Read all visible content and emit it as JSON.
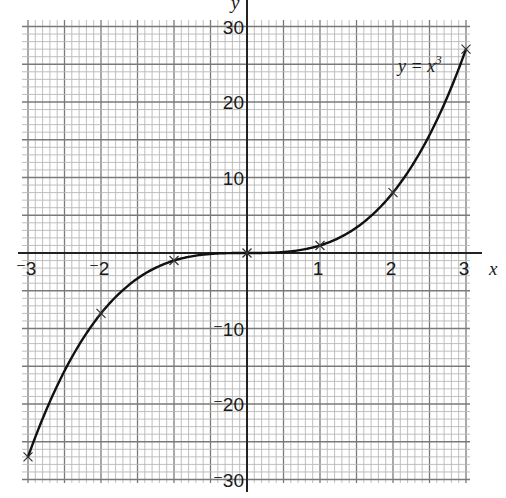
{
  "chart_data": {
    "type": "line",
    "title": "",
    "function_label": "y = x³",
    "function_label_base": "y = x",
    "function_label_exponent": "3",
    "xlabel": "x",
    "ylabel": "y",
    "xlim": [
      -3,
      3
    ],
    "ylim": [
      -30,
      30
    ],
    "grid": true,
    "grid_style": "graph paper: minor lines every 0.1 in x and 1 in y; bold lines every 0.5 in x and 5 in y",
    "x_tick_labels": [
      "⁻3",
      "⁻2",
      "1",
      "2",
      "3"
    ],
    "x_tick_values": [
      -3,
      -2,
      1,
      2,
      3
    ],
    "y_tick_labels": [
      "30",
      "20",
      "10",
      "⁻10",
      "⁻20",
      "⁻30"
    ],
    "y_tick_values": [
      30,
      20,
      10,
      -10,
      -20,
      -30
    ],
    "series": [
      {
        "name": "y = x³",
        "x": [
          -3,
          -2,
          -1,
          0,
          1,
          2,
          3
        ],
        "y": [
          -27,
          -8,
          -1,
          0,
          1,
          8,
          27
        ],
        "marker": "x",
        "line": "smooth curve"
      }
    ],
    "colors": {
      "curve": "#111111",
      "axes": "#222222",
      "grid_minor": "#b8b8b8",
      "grid_major": "#7a7a7a",
      "background": "#ffffff"
    }
  }
}
